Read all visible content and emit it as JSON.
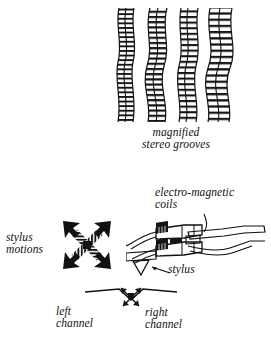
{
  "figure": {
    "background_color": "#ffffff",
    "ink_color": "#111111"
  },
  "grooves": {
    "caption": "magnified\nstereo grooves",
    "icon": "stereo-groove-strips-illustration",
    "strip_count": 4,
    "strips": [
      {
        "x": 5,
        "amplitude": 4,
        "rungs": 26
      },
      {
        "x": 36,
        "amplitude": 7,
        "rungs": 24
      },
      {
        "x": 66,
        "amplitude": 5,
        "rungs": 25
      },
      {
        "x": 95,
        "amplitude": 8,
        "rungs": 23
      }
    ]
  },
  "cartridge": {
    "coils_label": "electro-magnetic\ncoils",
    "stylus_label": "stylus",
    "icon": "phono-cartridge-illustration",
    "leader_coils": "leader-line-to-coils",
    "leader_stylus": "leader-line-to-stylus"
  },
  "stylus_motions": {
    "label": "stylus\nmotions",
    "icon": "four-way-diagonal-arrow-cross"
  },
  "channels": {
    "left_label": "left\nchannel",
    "right_label": "right\nchannel",
    "icon": "v-groove-cross-section-with-channel-arrows"
  }
}
